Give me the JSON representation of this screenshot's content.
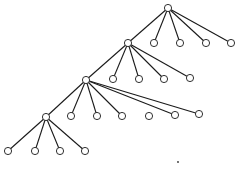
{
  "diagram": {
    "type": "tree",
    "colors": {
      "line": "#1a1a1a",
      "node_fill": "#ffffff",
      "background": "#ffffff"
    },
    "node_radius": 3.6,
    "nodes": [
      {
        "id": "n0",
        "x": 168,
        "y": 8
      },
      {
        "id": "n0c1",
        "x": 154,
        "y": 43
      },
      {
        "id": "n0c2",
        "x": 180,
        "y": 43
      },
      {
        "id": "n0c3",
        "x": 206,
        "y": 43
      },
      {
        "id": "n0c4",
        "x": 231,
        "y": 43
      },
      {
        "id": "n1",
        "x": 128,
        "y": 43
      },
      {
        "id": "n1c1",
        "x": 113,
        "y": 79
      },
      {
        "id": "n1c2",
        "x": 139,
        "y": 79
      },
      {
        "id": "n1c3",
        "x": 164,
        "y": 79
      },
      {
        "id": "n1c4",
        "x": 190,
        "y": 78
      },
      {
        "id": "n2",
        "x": 86,
        "y": 80
      },
      {
        "id": "n2c1",
        "x": 71,
        "y": 116
      },
      {
        "id": "n2c2",
        "x": 97,
        "y": 116
      },
      {
        "id": "n2c3",
        "x": 122,
        "y": 116
      },
      {
        "id": "n2c4",
        "x": 149,
        "y": 116
      },
      {
        "id": "n2c5",
        "x": 175,
        "y": 115
      },
      {
        "id": "n2c6",
        "x": 199,
        "y": 114
      },
      {
        "id": "n3",
        "x": 46,
        "y": 117
      },
      {
        "id": "n3c1",
        "x": 8,
        "y": 151
      },
      {
        "id": "n3c2",
        "x": 35,
        "y": 151
      },
      {
        "id": "n3c3",
        "x": 60,
        "y": 151
      },
      {
        "id": "n3c4",
        "x": 85,
        "y": 151
      }
    ],
    "edges": [
      [
        "n0",
        "n1"
      ],
      [
        "n0",
        "n0c1"
      ],
      [
        "n0",
        "n0c2"
      ],
      [
        "n0",
        "n0c3"
      ],
      [
        "n0",
        "n0c4"
      ],
      [
        "n1",
        "n2"
      ],
      [
        "n1",
        "n1c1"
      ],
      [
        "n1",
        "n1c2"
      ],
      [
        "n1",
        "n1c3"
      ],
      [
        "n1",
        "n1c4"
      ],
      [
        "n2",
        "n3"
      ],
      [
        "n2",
        "n2c1"
      ],
      [
        "n2",
        "n2c2"
      ],
      [
        "n2",
        "n2c3"
      ],
      [
        "n2",
        "n2c5"
      ],
      [
        "n2",
        "n2c6"
      ],
      [
        "n3",
        "n3c1"
      ],
      [
        "n3",
        "n3c2"
      ],
      [
        "n3",
        "n3c3"
      ],
      [
        "n3",
        "n3c4"
      ]
    ],
    "stray_marks": [
      {
        "id": "dot",
        "x": 178,
        "y": 162,
        "r": 0.9
      }
    ]
  }
}
